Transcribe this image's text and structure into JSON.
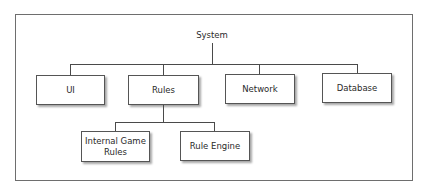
{
  "diagram": {
    "type": "hierarchy",
    "root": {
      "label": "System"
    },
    "level1": [
      {
        "label": "UI"
      },
      {
        "label": "Rules"
      },
      {
        "label": "Network"
      },
      {
        "label": "Database"
      }
    ],
    "rules_children": [
      {
        "label": "Internal Game\nRules"
      },
      {
        "label": "Rule Engine"
      }
    ],
    "edges": [
      [
        "System",
        "UI"
      ],
      [
        "System",
        "Rules"
      ],
      [
        "System",
        "Network"
      ],
      [
        "System",
        "Database"
      ],
      [
        "Rules",
        "Internal Game Rules"
      ],
      [
        "Rules",
        "Rule Engine"
      ]
    ],
    "colors": {
      "background": "#ffffff",
      "border": "#555555",
      "line": "#4a4a4a",
      "text": "#2a2a2a"
    }
  }
}
